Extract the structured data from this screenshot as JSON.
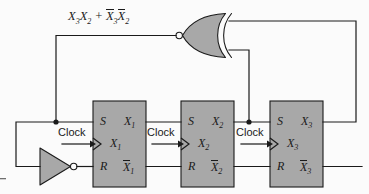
{
  "diagram": {
    "background_color": "#fbfbfb",
    "block_fill_color": "#a8a8a8",
    "line_color": "#1a1a1a",
    "feedback_expression": {
      "term1_a": "X",
      "term1_a_sub": "3",
      "term1_b": "X",
      "term1_b_sub": "2",
      "operator": "+",
      "term2_a": "X",
      "term2_a_sub": "3",
      "term2_b": "X",
      "term2_b_sub": "2",
      "full_text": "X3X2 + X3X2"
    },
    "gate": {
      "name": "nor-gate",
      "type": "NOR",
      "orientation": "mirrored-output-left",
      "inputs": 2,
      "has_output_bubble": true
    },
    "inverter": {
      "name": "inverter",
      "type": "NOT",
      "has_output_bubble": true
    },
    "flipflops": [
      {
        "name": "flipflop-1",
        "set_label": "S",
        "reset_label": "R",
        "clock_label": "Clock",
        "state_label": "X",
        "state_sub": "1",
        "q_label": "X",
        "q_sub": "1",
        "qbar_label": "X",
        "qbar_sub": "1"
      },
      {
        "name": "flipflop-2",
        "set_label": "S",
        "reset_label": "R",
        "clock_label": "Clock",
        "state_label": "X",
        "state_sub": "2",
        "q_label": "X",
        "q_sub": "2",
        "qbar_label": "X",
        "qbar_sub": "2"
      },
      {
        "name": "flipflop-3",
        "set_label": "S",
        "reset_label": "R",
        "clock_label": "Clock",
        "state_label": "X",
        "state_sub": "3",
        "q_label": "X",
        "q_sub": "3",
        "qbar_label": "X",
        "qbar_sub": "3"
      }
    ]
  }
}
